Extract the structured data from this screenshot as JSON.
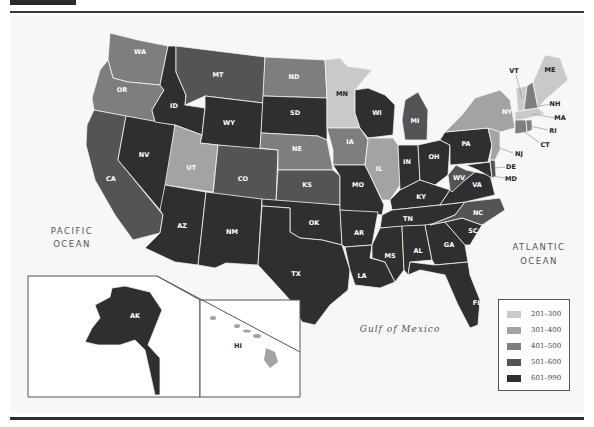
{
  "map": {
    "type": "choropleth",
    "region": "United States",
    "ocean_labels": {
      "pacific_line1": "PACIFIC",
      "pacific_line2": "OCEAN",
      "atlantic_line1": "ATLANTIC",
      "atlantic_line2": "OCEAN",
      "gulf": "Gulf of Mexico"
    },
    "legend": [
      {
        "label": "201–300",
        "color": "#c9c9c9"
      },
      {
        "label": "301–400",
        "color": "#a3a3a3"
      },
      {
        "label": "401–500",
        "color": "#7e7e7e"
      },
      {
        "label": "501–600",
        "color": "#545454"
      },
      {
        "label": "601–990",
        "color": "#2f2f2f"
      }
    ],
    "states": {
      "WA": "401–500",
      "OR": "401–500",
      "CA": "501–600",
      "ID": "601–990",
      "NV": "601–990",
      "MT": "501–600",
      "WY": "601–990",
      "UT": "301–400",
      "AZ": "601–990",
      "CO": "501–600",
      "NM": "601–990",
      "ND": "401–500",
      "SD": "601–990",
      "NE": "401–500",
      "KS": "501–600",
      "OK": "601–990",
      "TX": "601–990",
      "MN": "201–300",
      "IA": "401–500",
      "MO": "601–990",
      "AR": "601–990",
      "LA": "601–990",
      "WI": "601–990",
      "IL": "301–400",
      "MI": "501–600",
      "IN": "601–990",
      "OH": "601–990",
      "KY": "601–990",
      "TN": "601–990",
      "MS": "601–990",
      "AL": "601–990",
      "GA": "601–990",
      "FL": "601–990",
      "SC": "601–990",
      "NC": "501–600",
      "VA": "601–990",
      "WV": "501–600",
      "PA": "601–990",
      "NY": "301–400",
      "VT": "201–300",
      "NH": "401–500",
      "ME": "201–300",
      "MA": "201–300",
      "RI": "401–500",
      "CT": "401–500",
      "NJ": "301–400",
      "DE": "501–600",
      "MD": "601–990",
      "AK": "601–990",
      "HI": "301–400"
    },
    "labels": {
      "WA": "WA",
      "OR": "OR",
      "CA": "CA",
      "ID": "ID",
      "NV": "NV",
      "MT": "MT",
      "WY": "WY",
      "UT": "UT",
      "AZ": "AZ",
      "CO": "CO",
      "NM": "NM",
      "ND": "ND",
      "SD": "SD",
      "NE": "NE",
      "KS": "KS",
      "OK": "OK",
      "TX": "TX",
      "MN": "MN",
      "IA": "IA",
      "MO": "MO",
      "AR": "AR",
      "LA": "LA",
      "WI": "WI",
      "IL": "IL",
      "MI": "MI",
      "IN": "IN",
      "OH": "OH",
      "KY": "KY",
      "TN": "TN",
      "MS": "MS",
      "AL": "AL",
      "GA": "GA",
      "FL": "FL",
      "SC": "SC",
      "NC": "NC",
      "VA": "VA",
      "WV": "WV",
      "PA": "PA",
      "NY": "NY",
      "VT": "VT",
      "NH": "NH",
      "ME": "ME",
      "MA": "MA",
      "RI": "RI",
      "CT": "CT",
      "NJ": "NJ",
      "DE": "DE",
      "MD": "MD",
      "AK": "AK",
      "HI": "HI"
    }
  }
}
